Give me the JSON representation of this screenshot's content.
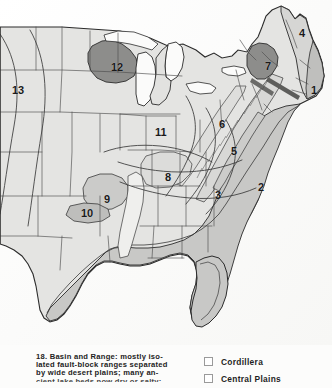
{
  "figure": {
    "caption_number": "18.",
    "caption_lines": [
      "18. Basin and Range: mostly iso-",
      "lated fault-block ranges separated",
      "by wide desert plains; many an-",
      "cient lake beds now dry or salty;"
    ]
  },
  "legend": {
    "items": [
      {
        "label": "Cordillera",
        "swatch": "empty-square",
        "color": "#ffffff"
      },
      {
        "label": "Central Plains",
        "swatch": "empty-square",
        "color": "#ffffff"
      }
    ]
  },
  "map": {
    "title": "Physiographic provinces of the eastern United States",
    "palette": {
      "paper": "#fcfcfb",
      "land_light": "#e3e3e1",
      "land_mid": "#cfcfcd",
      "province_gray": "#b9b9b7",
      "province_dark": "#8d8d8b",
      "outline": "#2b2b2b",
      "border_thin": "#5a5a5a",
      "label": "#1a1a1a"
    },
    "number_labels": [
      {
        "text": "1",
        "x": 311,
        "y": 85
      },
      {
        "text": "2",
        "x": 258,
        "y": 182
      },
      {
        "text": "3",
        "x": 215,
        "y": 190
      },
      {
        "text": "4",
        "x": 299,
        "y": 28
      },
      {
        "text": "5",
        "x": 231,
        "y": 146
      },
      {
        "text": "6",
        "x": 219,
        "y": 119
      },
      {
        "text": "7",
        "x": 265,
        "y": 61
      },
      {
        "text": "8",
        "x": 165,
        "y": 172
      },
      {
        "text": "9",
        "x": 104,
        "y": 194
      },
      {
        "text": "10",
        "x": 81,
        "y": 208
      },
      {
        "text": "11",
        "x": 155,
        "y": 127
      },
      {
        "text": "12",
        "x": 111,
        "y": 62
      },
      {
        "text": "13",
        "x": 12,
        "y": 85
      }
    ]
  }
}
